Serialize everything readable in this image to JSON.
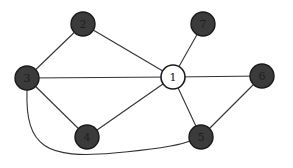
{
  "diagram": {
    "type": "undirected-graph",
    "colors": {
      "background": "#ffffff",
      "edge": "#333333",
      "node_dark_fill": "#3b3b3b",
      "node_light_fill": "#ffffff",
      "node_stroke": "#1a1a1a"
    },
    "nodes": [
      {
        "id": "1",
        "label": "1",
        "x": 173,
        "y": 77,
        "r": 12,
        "style": "light"
      },
      {
        "id": "2",
        "label": "2",
        "x": 83,
        "y": 24,
        "r": 12,
        "style": "dark"
      },
      {
        "id": "3",
        "label": "3",
        "x": 27,
        "y": 78,
        "r": 12,
        "style": "dark"
      },
      {
        "id": "4",
        "label": "4",
        "x": 87,
        "y": 137,
        "r": 12,
        "style": "dark"
      },
      {
        "id": "5",
        "label": "5",
        "x": 201,
        "y": 137,
        "r": 12,
        "style": "dark"
      },
      {
        "id": "6",
        "label": "6",
        "x": 262,
        "y": 76,
        "r": 12,
        "style": "dark"
      },
      {
        "id": "7",
        "label": "7",
        "x": 203,
        "y": 24,
        "r": 12,
        "style": "dark"
      }
    ],
    "edges": [
      {
        "from": "3",
        "to": "2",
        "shape": "straight"
      },
      {
        "from": "2",
        "to": "1",
        "shape": "straight"
      },
      {
        "from": "3",
        "to": "1",
        "shape": "straight"
      },
      {
        "from": "3",
        "to": "4",
        "shape": "straight"
      },
      {
        "from": "4",
        "to": "1",
        "shape": "straight"
      },
      {
        "from": "1",
        "to": "7",
        "shape": "straight"
      },
      {
        "from": "1",
        "to": "6",
        "shape": "straight"
      },
      {
        "from": "1",
        "to": "5",
        "shape": "straight"
      },
      {
        "from": "5",
        "to": "6",
        "shape": "straight"
      },
      {
        "from": "3",
        "to": "5",
        "shape": "curved"
      }
    ]
  }
}
